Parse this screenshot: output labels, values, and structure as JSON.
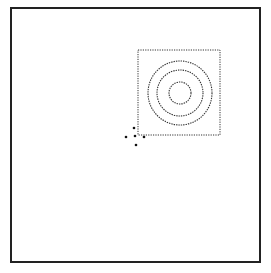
{
  "canvas": {
    "width": 271,
    "height": 273,
    "background": "#ffffff"
  },
  "frame": {
    "x": 11,
    "y": 8,
    "width": 249,
    "height": 254,
    "stroke": "#222222",
    "stroke_width": 2
  },
  "selection_box": {
    "x": 138,
    "y": 50,
    "width": 82,
    "height": 85,
    "stroke": "#333333",
    "style": "dotted"
  },
  "target_circles": {
    "cx": 180,
    "cy": 93,
    "radii": [
      11,
      23,
      32
    ],
    "stroke": "#333333",
    "style": "dotted"
  },
  "points": [
    {
      "x": 134,
      "y": 128
    },
    {
      "x": 126,
      "y": 137
    },
    {
      "x": 135,
      "y": 136
    },
    {
      "x": 144,
      "y": 137
    },
    {
      "x": 136,
      "y": 145
    }
  ],
  "point_color": "#111111",
  "point_radius": 1.3
}
